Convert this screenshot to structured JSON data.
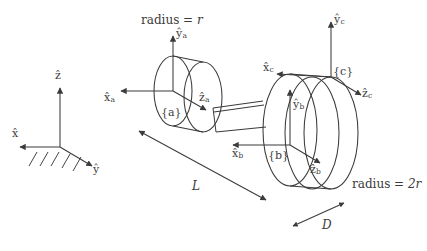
{
  "figure": {
    "stroke_color": "#3b3b3b",
    "background_color": "#ffffff"
  },
  "world_frame": {
    "name": "world-frame",
    "z_axis_label": "z",
    "x_axis_label": "x",
    "y_axis_label": "y",
    "ground_hatching": "ground-hatching"
  },
  "frame_a": {
    "tag": "{a}",
    "x_axis_label": "x",
    "x_axis_sub": "a",
    "y_axis_label": "y",
    "y_axis_sub": "a",
    "z_axis_label": "z",
    "z_axis_sub": "a"
  },
  "frame_b": {
    "tag": "{b}",
    "x_axis_label": "x",
    "x_axis_sub": "b",
    "y_axis_label": "y",
    "y_axis_sub": "b",
    "z_axis_label": "z",
    "z_axis_sub": "b"
  },
  "frame_c": {
    "tag": "{c}",
    "x_axis_label": "x",
    "x_axis_sub": "c",
    "y_axis_label": "y",
    "y_axis_sub": "c",
    "z_axis_label": "z",
    "z_axis_sub": "c"
  },
  "annotations": {
    "radius_small": "radius = r",
    "radius_small_value": "r",
    "radius_small_prefix": "radius = ",
    "radius_large": "radius = 2r",
    "radius_large_value": "2r",
    "radius_large_prefix": "radius = ",
    "length_label": "L",
    "depth_label": "D"
  }
}
